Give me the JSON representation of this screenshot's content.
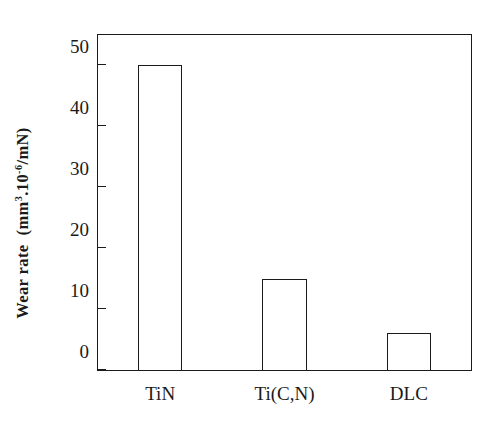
{
  "chart_data": {
    "type": "bar",
    "title": "",
    "xlabel": "",
    "ylabel": "Wear rate  (mm^3.10^-6/mN)",
    "ylabel_parts": {
      "name": "Wear rate",
      "unit_open": "(mm",
      "unit_exp1": "3",
      "unit_mid": ".10",
      "unit_exp2": "-6",
      "unit_close": "/mN)"
    },
    "categories": [
      "TiN",
      "Ti(C,N)",
      "DLC"
    ],
    "values": [
      50,
      15,
      6
    ],
    "yticks": [
      0,
      10,
      20,
      30,
      40,
      50
    ],
    "ytick_labels": [
      "0",
      "10",
      "20",
      "30",
      "40",
      "50"
    ],
    "ylim": [
      0,
      55
    ],
    "grid": false,
    "legend": null,
    "bar_style": {
      "fill": "#ffffff",
      "edge": "#1b1b1b"
    },
    "frame": {
      "color": "#1b1b1b",
      "box": true
    },
    "background": "#ffffff"
  }
}
